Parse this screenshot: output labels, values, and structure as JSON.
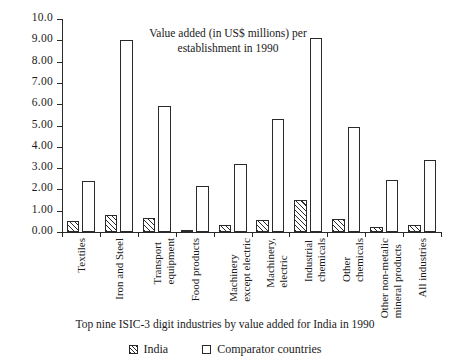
{
  "chart_data": {
    "type": "bar",
    "title": "Value added (in US$ millions) per establishment in 1990",
    "title_line1": "Value added (in US$ millions) per",
    "title_line2": "establishment in 1990",
    "xlabel": "Top nine ISIC-3 digit industries by value added for India in 1990",
    "ylabel": "",
    "ylim": [
      0,
      10
    ],
    "ytick_labels": [
      "10.0",
      "9.00",
      "8.00",
      "7.00",
      "6.00",
      "5.00",
      "4.00",
      "3.00",
      "2.00",
      "1.00",
      "0.00"
    ],
    "ytick_values": [
      10,
      9,
      8,
      7,
      6,
      5,
      4,
      3,
      2,
      1,
      0
    ],
    "grid": false,
    "legend_position": "bottom",
    "categories": [
      "Textiles",
      "Iron and Steel",
      "Transport equipment",
      "Food products",
      "Machinery except electric",
      "Machinery, electric",
      "Industrial chemicals",
      "Other chemicals",
      "Other non-metalic mineral products",
      "All industries"
    ],
    "category_lines": [
      [
        "Textiles",
        ""
      ],
      [
        "Iron and Steel",
        ""
      ],
      [
        "Transport",
        "equipment"
      ],
      [
        "Food products",
        ""
      ],
      [
        "Machinery",
        "except electric"
      ],
      [
        "Machinery,",
        "electric"
      ],
      [
        "Industrial",
        "chemicals"
      ],
      [
        "Other",
        "chemicals"
      ],
      [
        "Other non-metalic",
        "mineral products"
      ],
      [
        "All industries",
        ""
      ]
    ],
    "series": [
      {
        "name": "India",
        "pattern": "hatched",
        "color": "#2a2a2a",
        "values": [
          0.5,
          0.8,
          0.65,
          0.1,
          0.35,
          0.55,
          1.5,
          0.6,
          0.25,
          0.35
        ]
      },
      {
        "name": "Comparator countries",
        "pattern": "open",
        "color": "#ffffff",
        "values": [
          2.4,
          9.0,
          5.9,
          2.15,
          3.2,
          5.3,
          9.1,
          4.95,
          2.45,
          3.4
        ]
      }
    ]
  },
  "legend": {
    "items": [
      {
        "label": "India",
        "swatch": "hatched-square-icon"
      },
      {
        "label": "Comparator countries",
        "swatch": "open-square-icon"
      }
    ]
  }
}
